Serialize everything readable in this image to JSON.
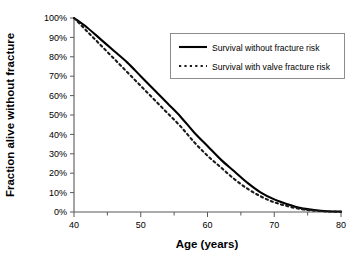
{
  "chart_data": {
    "type": "line",
    "title": "",
    "xlabel": "Age (years)",
    "ylabel": "Fraction alive without fracture",
    "xlim": [
      40,
      80
    ],
    "ylim": [
      0,
      100
    ],
    "grid": false,
    "legend_position": "top-right",
    "x_ticks": [
      40,
      50,
      60,
      70,
      80
    ],
    "x_tick_labels": [
      "40",
      "50",
      "60",
      "70",
      "80"
    ],
    "x_minor_ticks": [
      45,
      55,
      65,
      75
    ],
    "y_ticks": [
      0,
      10,
      20,
      30,
      40,
      50,
      60,
      70,
      80,
      90,
      100
    ],
    "y_tick_labels": [
      "0%",
      "10%",
      "20%",
      "30%",
      "40%",
      "50%",
      "60%",
      "70%",
      "80%",
      "90%",
      "100%"
    ],
    "x": [
      40,
      42,
      44,
      46,
      48,
      50,
      52,
      54,
      56,
      58,
      60,
      62,
      64,
      66,
      68,
      70,
      72,
      74,
      76,
      78,
      80
    ],
    "series": [
      {
        "name": "Survival without fracture risk",
        "style": "solid",
        "color": "#000000",
        "values": [
          100,
          95,
          89,
          83,
          77,
          70,
          63,
          56,
          49,
          41,
          34,
          27,
          21,
          15,
          10,
          6.5,
          4,
          2,
          1,
          0.4,
          0.2
        ]
      },
      {
        "name": "Survival with valve fracture risk",
        "style": "dotted",
        "color": "#1a1a1a",
        "values": [
          100,
          93,
          86,
          79,
          72,
          65,
          58,
          51,
          44,
          36,
          29,
          23,
          17,
          12,
          8,
          5,
          3,
          1.5,
          0.7,
          0.3,
          0.1
        ]
      }
    ]
  },
  "legend": {
    "entries": [
      {
        "label": "Survival without fracture risk",
        "style": "solid"
      },
      {
        "label": "Survival with valve fracture risk",
        "style": "dotted"
      }
    ]
  },
  "axes": {
    "x_title": "Age (years)",
    "y_title": "Fraction alive without fracture"
  }
}
